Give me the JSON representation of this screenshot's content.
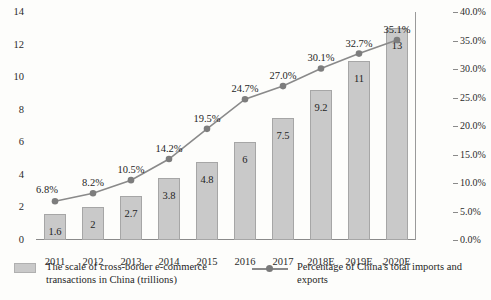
{
  "chart_data": {
    "type": "bar",
    "title": "",
    "subtitle": "",
    "xlabel": "",
    "ylabel": "",
    "grid": false,
    "legend_position": "bottom",
    "categories": [
      "2011",
      "2012",
      "2013",
      "2014",
      "2015",
      "2016",
      "2017",
      "2018E",
      "2019E",
      "2020E"
    ],
    "series": [
      {
        "name": "The scale of cross-border e-commerce transactions in China (trillions)",
        "type": "bar",
        "axis": "left",
        "values": [
          1.6,
          2,
          2.7,
          3.8,
          4.8,
          6,
          7.5,
          9.2,
          11,
          13
        ],
        "labels": [
          "1.6",
          "2",
          "2.7",
          "3.8",
          "4.8",
          "6",
          "7.5",
          "9.2",
          "11",
          "13"
        ],
        "color": "#c9c9c9"
      },
      {
        "name": "Percentage of China's total imports and exports",
        "type": "line",
        "axis": "right",
        "values": [
          6.8,
          8.2,
          10.5,
          14.2,
          19.5,
          24.7,
          27.0,
          30.1,
          32.7,
          35.1
        ],
        "labels": [
          "6.8%",
          "8.2%",
          "10.5%",
          "14.2%",
          "19.5%",
          "24.7%",
          "27.0%",
          "30.1%",
          "32.7%",
          "35.1%"
        ],
        "color": "#8a8a8a"
      }
    ],
    "left_axis": {
      "min": 0,
      "max": 14,
      "step": 2,
      "ticks": [
        "0",
        "2",
        "4",
        "6",
        "8",
        "10",
        "12",
        "14"
      ]
    },
    "right_axis": {
      "min": 0,
      "max": 40,
      "step": 5,
      "ticks": [
        "0.0%",
        "5.0%",
        "10.0%",
        "15.0%",
        "20.0%",
        "25.0%",
        "30.0%",
        "35.0%",
        "40.0%"
      ]
    }
  },
  "legend": {
    "bar_label": "The scale of cross-border e-commerce transactions in China (trillions)",
    "line_label": "Percentage of China's total imports and exports"
  }
}
